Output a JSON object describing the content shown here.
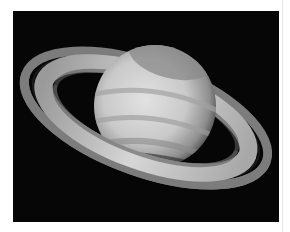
{
  "image": {
    "subject": "Saturn with ring system",
    "alt": "Grayscale photograph of the planet Saturn with its tilted rings against a black sky",
    "colors": {
      "background": "#ffffff",
      "sky": "#060606",
      "planet_light": "#d9d9d9",
      "planet_dark": "#7a7a7a",
      "ring_bright": "#cfcfcf",
      "ring_outer": "#8a8a8a",
      "cassini_division": "#1a1a1a"
    }
  }
}
